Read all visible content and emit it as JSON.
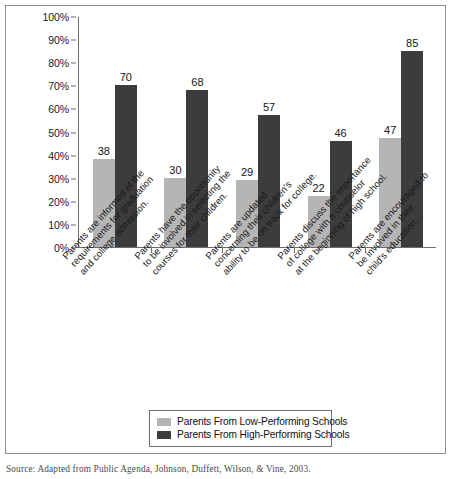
{
  "chart_data": {
    "type": "bar",
    "title": "",
    "xlabel": "",
    "ylabel": "",
    "ylim": [
      0,
      100
    ],
    "ytick_labels": [
      "0%",
      "10%",
      "20%",
      "30%",
      "40%",
      "50%",
      "60%",
      "70%",
      "80%",
      "90%",
      "100%"
    ],
    "ytick_values": [
      0,
      10,
      20,
      30,
      40,
      50,
      60,
      70,
      80,
      90,
      100
    ],
    "grid": false,
    "legend_position": "bottom-center",
    "categories": [
      "Parents are informed of the requirements for graduation and college admission.",
      "Parents have the opportunity to be involved in selecting the courses for their children.",
      "Parents are updated concerning their children's ability to be on track for college.",
      "Parents discuss the importance of college with a counselor at the beginning of high school.",
      "Parents are encouraged to be involved in their child's education."
    ],
    "category_lines": [
      [
        "Parents are informed of the",
        "requirements for graduation",
        "and college admission."
      ],
      [
        "Parents have the opportunity",
        "to be involved in selecting the",
        "courses for their children."
      ],
      [
        "Parents are updated",
        "concerning their children's",
        "ability to be on track for college."
      ],
      [
        "Parents discuss the importance",
        "of college with a counselor",
        "at the beginning of high school."
      ],
      [
        "Parents are encouraged to",
        "be involved in their",
        "child's education."
      ]
    ],
    "series": [
      {
        "name": "Parents From Low-Performing Schools",
        "color": "#b5b5b5",
        "values": [
          38,
          30,
          29,
          22,
          47
        ]
      },
      {
        "name": "Parents From High-Performing Schools",
        "color": "#3c3c3c",
        "values": [
          70,
          68,
          57,
          46,
          85
        ]
      }
    ]
  },
  "legend": {
    "items": [
      {
        "label": "Parents From Low-Performing Schools",
        "swatch": "low"
      },
      {
        "label": "Parents From High-Performing Schools",
        "swatch": "high"
      }
    ]
  },
  "source": {
    "text": "Source: Adapted from Public Agenda, Johnson, Duffett, Wilson, & Vine, 2003."
  }
}
